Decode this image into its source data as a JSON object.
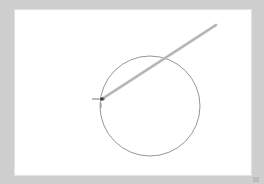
{
  "canvas": {
    "background": "#ffffff",
    "frame_color": "#cfcfcf",
    "bounds": {
      "x": 14,
      "y": 9,
      "width": 238,
      "height": 167
    }
  },
  "shapes": {
    "circle": {
      "cx": 150,
      "cy": 106,
      "r": 50,
      "stroke": "#8a8a8a"
    },
    "rubberband_line": {
      "x1": 102,
      "y1": 99,
      "x2": 216,
      "y2": 25,
      "stroke_outer": "#c8c8c8",
      "stroke_inner": "#9a9a9a"
    },
    "anchor_point": {
      "x": 102,
      "y": 99,
      "color": "#333333"
    },
    "horizontal_tick": {
      "x1": 92,
      "x2": 105,
      "y": 99,
      "color": "#555555"
    },
    "vertical_tick": {
      "x": 101,
      "y1": 103,
      "y2": 108,
      "color": "#777777"
    }
  }
}
